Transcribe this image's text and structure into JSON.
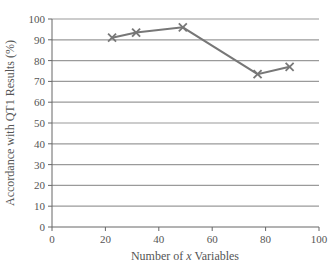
{
  "chart_data": {
    "type": "line",
    "title": "",
    "xlabel": "Number of x Variables",
    "xlabel_parts": [
      "Number of ",
      "x",
      " Variables"
    ],
    "ylabel": "Accordance with QT1 Results (%)",
    "xlim": [
      0,
      100
    ],
    "ylim": [
      0,
      100
    ],
    "x_ticks": [
      0,
      20,
      40,
      60,
      80,
      100
    ],
    "y_ticks": [
      0,
      10,
      20,
      30,
      40,
      50,
      60,
      70,
      80,
      90,
      100
    ],
    "grid": {
      "horizontal": true,
      "vertical": false
    },
    "legend": null,
    "series": [
      {
        "name": "Accordance",
        "marker": "x",
        "color": "#777777",
        "x": [
          22.5,
          31.5,
          49,
          77,
          89
        ],
        "y": [
          91,
          93.5,
          96,
          73.5,
          77
        ]
      }
    ]
  },
  "colors": {
    "line": "#777777",
    "grid": "#9a9a9a",
    "axis": "#666666",
    "text": "#555555"
  }
}
